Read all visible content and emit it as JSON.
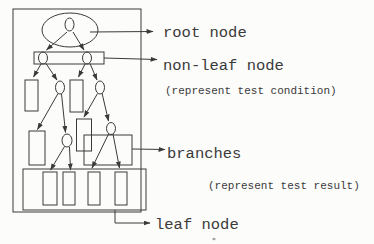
{
  "diagram": {
    "type": "decision-tree-annotated-sketch",
    "colors": {
      "ink": "#3a3a3a",
      "paper": "#fcfcfa"
    },
    "annotations": {
      "root_label": "root node",
      "non_leaf_label": "non-leaf node",
      "non_leaf_note": "(represent test condition)",
      "branches_label": "branches",
      "branches_note": "(represent test result)",
      "leaf_label": "leaf node"
    }
  }
}
